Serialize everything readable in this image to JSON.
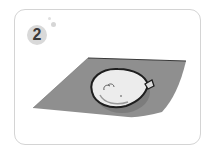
{
  "card": {
    "step_number": "2",
    "illustration": "balloon-on-sheet"
  },
  "colors": {
    "sheet": "#8f8f8f",
    "sheet_edge": "#3a3a3a",
    "balloon_fill": "#ececec",
    "balloon_outline": "#1e1e1e",
    "badge": "#d9d9d9",
    "card_border": "#d4d4d4"
  }
}
